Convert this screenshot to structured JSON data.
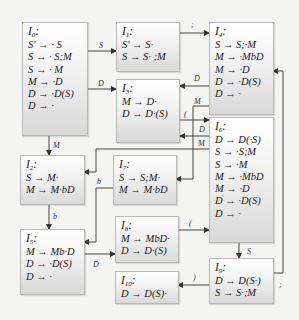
{
  "diagram": {
    "type": "LR(0) item-set automaton",
    "states": [
      {
        "id": "I0",
        "name": "I",
        "sub": "0",
        "items": [
          "S' → · S",
          "S → · S;M",
          "S → · M",
          "M → ·D",
          "D → ·D(S)",
          "D → ·"
        ]
      },
      {
        "id": "I1",
        "name": "I",
        "sub": "1",
        "items": [
          "S' → S·",
          "S → S· ;M"
        ]
      },
      {
        "id": "I2",
        "name": "I",
        "sub": "2",
        "items": [
          "S → M·",
          "M → M·bD"
        ]
      },
      {
        "id": "I3",
        "name": "I",
        "sub": "3",
        "items": [
          "M → D·",
          "D → D·(S)"
        ]
      },
      {
        "id": "I4",
        "name": "I",
        "sub": "4",
        "items": [
          "S → S;·M",
          "M → ·MbD",
          "M → ·D",
          "D → ·D(S)",
          "D → ·"
        ]
      },
      {
        "id": "I5",
        "name": "I",
        "sub": "5",
        "items": [
          "M → Mb·D",
          "D → ·D(S)",
          "D → ·"
        ]
      },
      {
        "id": "I6",
        "name": "I",
        "sub": "6",
        "items": [
          "D → D(·S)",
          "S → ·S;M",
          "S → ·M",
          "M → ·MbD",
          "M → ·D",
          "D → ·D(S)",
          "D → ·"
        ]
      },
      {
        "id": "I7",
        "name": "I",
        "sub": "7",
        "items": [
          "S → S;M·",
          "M → M·bD"
        ]
      },
      {
        "id": "I8",
        "name": "I",
        "sub": "8",
        "items": [
          "M → MbD·",
          "D → D·(S)"
        ]
      },
      {
        "id": "I9",
        "name": "I",
        "sub": "9",
        "items": [
          "D → D(S·)",
          "S → S·;M"
        ]
      },
      {
        "id": "I10",
        "name": "I",
        "sub": "10",
        "items": [
          "D → D(S)·"
        ]
      }
    ],
    "edges": [
      {
        "from": "I0",
        "to": "I1",
        "label": "S"
      },
      {
        "from": "I0",
        "to": "I3",
        "label": "D"
      },
      {
        "from": "I0",
        "to": "I2",
        "label": "M"
      },
      {
        "from": "I1",
        "to": "I4",
        "label": ";"
      },
      {
        "from": "I4",
        "to": "I3",
        "label": "D"
      },
      {
        "from": "I4",
        "to": "I7",
        "label": "M"
      },
      {
        "from": "I3",
        "to": "I6",
        "label": "("
      },
      {
        "from": "I6",
        "to": "I3",
        "label": "D"
      },
      {
        "from": "I6",
        "to": "I2",
        "label": "M"
      },
      {
        "from": "I2",
        "to": "I5",
        "label": "b"
      },
      {
        "from": "I7",
        "to": "I5",
        "label": "b"
      },
      {
        "from": "I5",
        "to": "I8",
        "label": "D"
      },
      {
        "from": "I8",
        "to": "I6",
        "label": "("
      },
      {
        "from": "I6",
        "to": "I9",
        "label": "S"
      },
      {
        "from": "I9",
        "to": "I10",
        "label": ")"
      },
      {
        "from": "I9",
        "to": "I4",
        "label": ";"
      }
    ]
  }
}
